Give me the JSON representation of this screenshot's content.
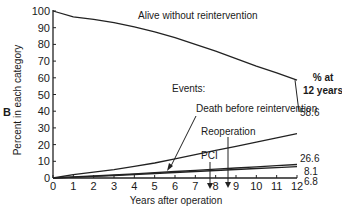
{
  "panel_label": "B",
  "chart_data": {
    "type": "line",
    "title": "",
    "xlabel": "Years after operation",
    "ylabel": "Percent in each category",
    "xlim": [
      0,
      12
    ],
    "ylim": [
      0,
      100
    ],
    "x_ticks": [
      0,
      1,
      2,
      3,
      4,
      5,
      6,
      7,
      8,
      9,
      10,
      11,
      12
    ],
    "y_ticks": [
      0,
      10,
      20,
      30,
      40,
      50,
      60,
      70,
      80,
      90,
      100
    ],
    "grid": false,
    "x": [
      0,
      1,
      2,
      3,
      4,
      5,
      6,
      7,
      8,
      9,
      10,
      11,
      12
    ],
    "series": [
      {
        "name": "Alive without reintervention",
        "values": [
          100,
          96.5,
          95,
          93,
          90.5,
          87.5,
          84,
          80,
          76,
          71.5,
          67,
          63,
          58.6
        ],
        "label_at_12": "58.6"
      },
      {
        "name": "Death before reintervention",
        "values": [
          0,
          2,
          3.5,
          5,
          7,
          9,
          11.5,
          14,
          16.5,
          19,
          21.5,
          24,
          26.6
        ],
        "label_at_12": "26.6"
      },
      {
        "name": "Reoperation",
        "values": [
          0,
          0.6,
          1.2,
          1.8,
          2.5,
          3.2,
          3.9,
          4.6,
          5.3,
          6,
          6.7,
          7.4,
          8.1
        ],
        "label_at_12": "8.1"
      },
      {
        "name": "PCI",
        "values": [
          0,
          0.5,
          1,
          1.5,
          2.1,
          2.7,
          3.3,
          3.9,
          4.5,
          5.1,
          5.7,
          6.2,
          6.8
        ],
        "label_at_12": "6.8"
      }
    ],
    "annotations": {
      "header": "% at\n12 years",
      "events_label": "Events:",
      "alive_label": "Alive without reintervention",
      "death_label": "Death before reintervention",
      "reop_label": "Reoperation",
      "pci_label": "PCI"
    },
    "legend": "none (direct labels)"
  },
  "labels": {
    "pct_at": "% at",
    "years12": "12 years",
    "v586": "58.6",
    "v266": "26.6",
    "v81": "8.1",
    "v68": "6.8"
  }
}
